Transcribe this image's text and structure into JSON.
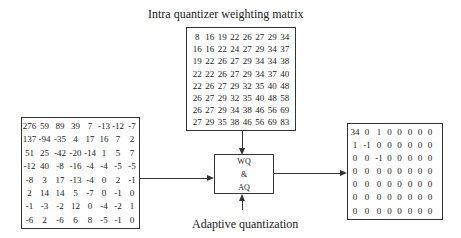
{
  "labels": {
    "top_title": "Intra quantizer weighting matrix",
    "bottom_title": "Adaptive quantization",
    "box_line1": "WQ",
    "box_line2": "&",
    "box_line3": "AQ"
  },
  "weighting_matrix": [
    [
      "8",
      "16",
      "19",
      "22",
      "26",
      "27",
      "29",
      "34"
    ],
    [
      "16",
      "16",
      "22",
      "24",
      "27",
      "29",
      "34",
      "37"
    ],
    [
      "19",
      "22",
      "26",
      "27",
      "29",
      "34",
      "34",
      "38"
    ],
    [
      "22",
      "22",
      "26",
      "27",
      "29",
      "34",
      "37",
      "40"
    ],
    [
      "22",
      "26",
      "27",
      "29",
      "32",
      "35",
      "40",
      "48"
    ],
    [
      "26",
      "27",
      "29",
      "32",
      "35",
      "40",
      "48",
      "58"
    ],
    [
      "26",
      "27",
      "29",
      "34",
      "38",
      "46",
      "56",
      "69"
    ],
    [
      "27",
      "29",
      "35",
      "38",
      "46",
      "56",
      "69",
      "83"
    ]
  ],
  "input_matrix": [
    [
      "276",
      "59",
      "89",
      "39",
      "7",
      "-13",
      "-12",
      "-7"
    ],
    [
      "137",
      "-94",
      "-35",
      "4",
      "17",
      "16",
      "7",
      "2"
    ],
    [
      "51",
      "25",
      "-42",
      "-20",
      "-14",
      "1",
      "5",
      "7"
    ],
    [
      "-12",
      "40",
      "-8",
      "-16",
      "-4",
      "-4",
      "-5",
      "-5"
    ],
    [
      "-8",
      "3",
      "17",
      "-13",
      "-4",
      "0",
      "2",
      "-1"
    ],
    [
      "2",
      "14",
      "14",
      "5",
      "-7",
      "0",
      "-1",
      "0"
    ],
    [
      "-1",
      "-3",
      "-2",
      "12",
      "0",
      "-4",
      "-2",
      "1"
    ],
    [
      "-6",
      "2",
      "-6",
      "6",
      "8",
      "-5",
      "-1",
      "0"
    ]
  ],
  "output_matrix": [
    [
      "34",
      "0",
      "1",
      "0",
      "0",
      "0",
      "0",
      "0"
    ],
    [
      "1",
      "-1",
      "0",
      "0",
      "0",
      "0",
      "0",
      "0"
    ],
    [
      "0",
      "0",
      "-1",
      "0",
      "0",
      "0",
      "0",
      "0"
    ],
    [
      "0",
      "0",
      "0",
      "0",
      "0",
      "0",
      "0",
      "0"
    ],
    [
      "0",
      "0",
      "0",
      "0",
      "0",
      "0",
      "0",
      "0"
    ],
    [
      "0",
      "0",
      "0",
      "0",
      "0",
      "0",
      "0",
      "0"
    ],
    [
      "0",
      "0",
      "0",
      "0",
      "0",
      "0",
      "0",
      "0"
    ]
  ]
}
